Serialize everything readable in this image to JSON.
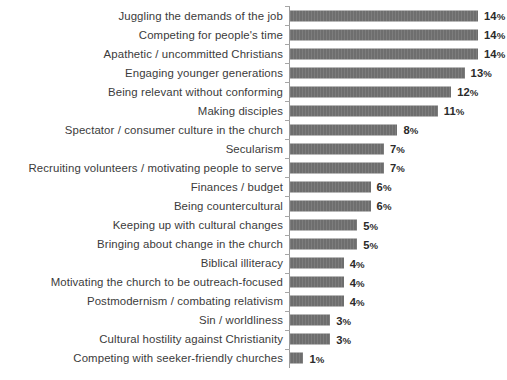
{
  "chart_data": {
    "type": "bar",
    "orientation": "horizontal",
    "title": "",
    "subtitle": "",
    "xlabel": "",
    "ylabel": "",
    "xlim": [
      0,
      14
    ],
    "grid": false,
    "legend": null,
    "value_suffix": "%",
    "bar_color": "#6e6e6e",
    "label_color": "#3b3b3b",
    "value_color": "#2b2b2b",
    "background_color": "#ffffff",
    "axis_color": "#9b9b9b",
    "categories": [
      "Juggling the demands of the job",
      "Competing for people's time",
      "Apathetic / uncommitted Christians",
      "Engaging younger generations",
      "Being relevant without conforming",
      "Making disciples",
      "Spectator / consumer culture in the church",
      "Secularism",
      "Recruiting volunteers / motivating people to serve",
      "Finances / budget",
      "Being countercultural",
      "Keeping up with cultural changes",
      "Bringing about change in the church",
      "Biblical illiteracy",
      "Motivating the church to be outreach-focused",
      "Postmodernism / combating relativism",
      "Sin / worldliness",
      "Cultural hostility against Christianity",
      "Competing with seeker-friendly churches"
    ],
    "values": [
      14,
      14,
      14,
      13,
      12,
      11,
      8,
      7,
      7,
      6,
      6,
      5,
      5,
      4,
      4,
      4,
      3,
      3,
      1
    ],
    "value_labels": [
      "14%",
      "14%",
      "14%",
      "13%",
      "12%",
      "11%",
      "8%",
      "7%",
      "7%",
      "6%",
      "6%",
      "5%",
      "5%",
      "4%",
      "4%",
      "4%",
      "3%",
      "3%",
      "1%"
    ]
  }
}
